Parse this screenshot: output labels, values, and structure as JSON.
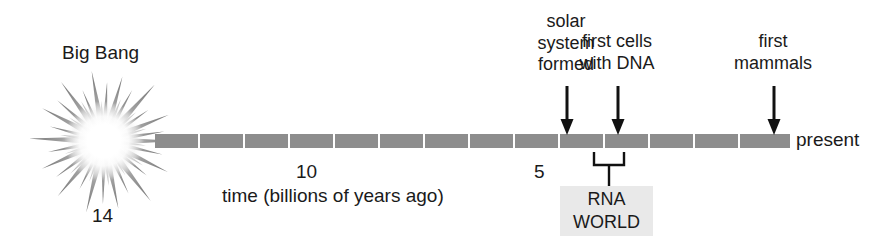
{
  "figure": {
    "type": "timeline",
    "background_color": "#ffffff",
    "bar_color": "#8d8d8d",
    "box_color": "#e9e9e9",
    "text_color": "#1a1a1a"
  },
  "origin": {
    "burst_label": "Big Bang",
    "age_label": "14",
    "icon": "starburst-icon"
  },
  "axis": {
    "caption": "time (billions of years ago)",
    "end_label": "present",
    "ticks": [
      {
        "label": "10",
        "value": 10
      },
      {
        "label": "5",
        "value": 5
      }
    ],
    "range_start": 14,
    "range_end": 0,
    "segment_count": 14
  },
  "events": [
    {
      "id": "solar-system-formed",
      "label": "solar\nsystem\nformed",
      "approx_value": 4.6
    },
    {
      "id": "first-cells-with-dna",
      "label": "first cells\nwith DNA",
      "approx_value": 3.5
    },
    {
      "id": "first-mammals",
      "label": "first\nmammals",
      "approx_value": 0.2
    }
  ],
  "annotation": {
    "id": "rna-world",
    "line1": "RNA",
    "line2": "WORLD",
    "bracket_start_value": 4.0,
    "bracket_end_value": 3.4
  }
}
